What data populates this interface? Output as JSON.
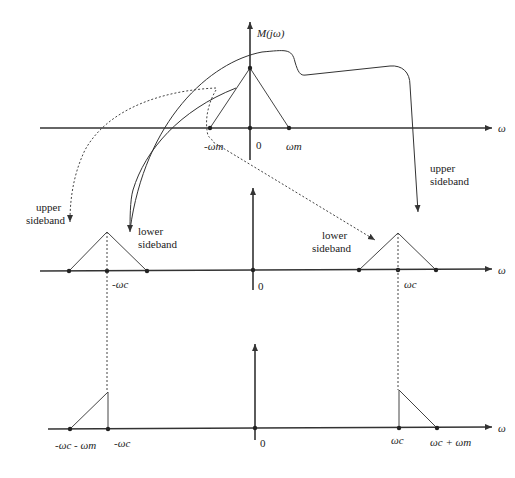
{
  "diagram": {
    "top_panel": {
      "y_axis_label": "M(jω)",
      "x_axis_label": "ω",
      "ticks": [
        "-ωm",
        "0",
        "ωm"
      ]
    },
    "middle_panel": {
      "x_axis_label": "ω",
      "ticks": [
        "-ωc",
        "0",
        "ωc"
      ],
      "annotations": {
        "left_upper": "upper\nsideband",
        "left_lower": "lower\nsideband",
        "right_lower": "lower\nsideband",
        "right_upper": "upper\nsideband"
      },
      "annotation_lines": {
        "upper": "upper",
        "sideband": "sideband",
        "lower": "lower"
      }
    },
    "bottom_panel": {
      "x_axis_label": "ω",
      "ticks": [
        "-ωc - ωm",
        "-ωc",
        "0",
        "ωc",
        "ωc + ωm"
      ]
    }
  }
}
